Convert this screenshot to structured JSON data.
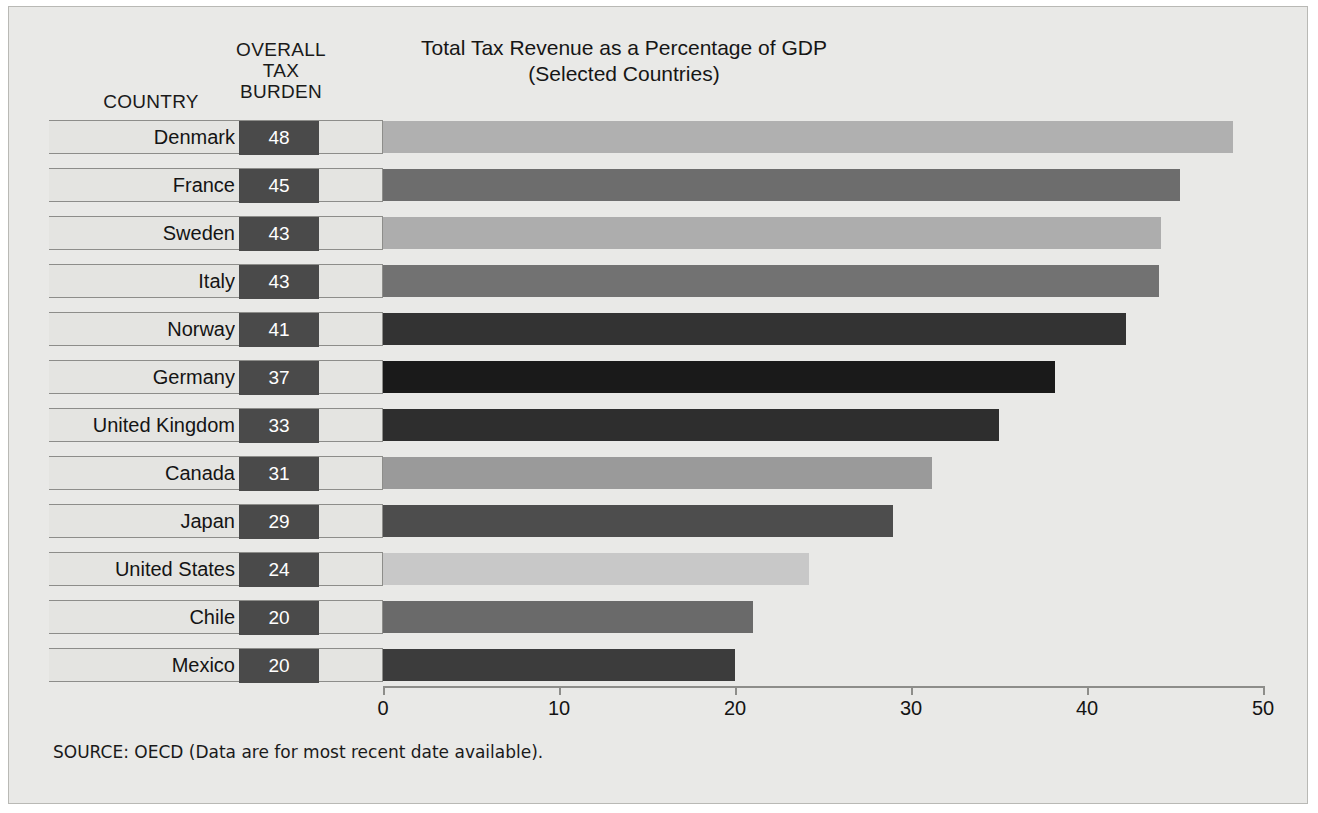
{
  "headers": {
    "country": "COUNTRY",
    "burden": "OVERALL\nTAX\nBURDEN"
  },
  "title": "Total Tax Revenue as a Percentage of GDP\n(Selected Countries)",
  "source": "SOURCE: OECD (Data are for most recent date available).",
  "chart_data": {
    "type": "bar",
    "orientation": "horizontal",
    "title": "Total Tax Revenue as a Percentage of GDP (Selected Countries)",
    "xlabel": "",
    "ylabel": "",
    "xlim": [
      0,
      50
    ],
    "ticks": [
      0,
      10,
      20,
      30,
      40,
      50
    ],
    "tick_labels": [
      "0",
      "10",
      "20",
      "30",
      "40",
      "50"
    ],
    "grid": false,
    "legend": "none",
    "categories": [
      "Denmark",
      "France",
      "Sweden",
      "Italy",
      "Norway",
      "Germany",
      "United Kingdom",
      "Canada",
      "Japan",
      "United States",
      "Chile",
      "Mexico"
    ],
    "values": [
      48,
      45,
      43,
      43,
      41,
      37,
      33,
      31,
      29,
      24,
      20,
      20
    ],
    "bar_lengths": [
      48.3,
      45.3,
      44.2,
      44.1,
      42.2,
      38.2,
      35.0,
      31.2,
      29.0,
      24.2,
      21.0,
      20.0
    ],
    "bar_colors": [
      "#b0b0b0",
      "#6d6d6d",
      "#adadad",
      "#727272",
      "#333333",
      "#1a1a1a",
      "#2e2e2e",
      "#9a9a9a",
      "#4d4d4d",
      "#c8c8c8",
      "#6a6a6a",
      "#3c3c3c"
    ],
    "rows": [
      {
        "country": "Denmark",
        "value": "48",
        "length": 48.3,
        "color": "#b0b0b0"
      },
      {
        "country": "France",
        "value": "45",
        "length": 45.3,
        "color": "#6d6d6d"
      },
      {
        "country": "Sweden",
        "value": "43",
        "length": 44.2,
        "color": "#adadad"
      },
      {
        "country": "Italy",
        "value": "43",
        "length": 44.1,
        "color": "#727272"
      },
      {
        "country": "Norway",
        "value": "41",
        "length": 42.2,
        "color": "#333333"
      },
      {
        "country": "Germany",
        "value": "37",
        "length": 38.2,
        "color": "#1a1a1a"
      },
      {
        "country": "United Kingdom",
        "value": "33",
        "length": 35.0,
        "color": "#2e2e2e"
      },
      {
        "country": "Canada",
        "value": "31",
        "length": 31.2,
        "color": "#9a9a9a"
      },
      {
        "country": "Japan",
        "value": "29",
        "length": 29.0,
        "color": "#4d4d4d"
      },
      {
        "country": "United States",
        "value": "24",
        "length": 24.2,
        "color": "#c8c8c8"
      },
      {
        "country": "Chile",
        "value": "20",
        "length": 21.0,
        "color": "#6a6a6a"
      },
      {
        "country": "Mexico",
        "value": "20",
        "length": 20.0,
        "color": "#3c3c3c"
      }
    ]
  },
  "geometry": {
    "x_zero_px": 374,
    "px_per_unit": 17.6,
    "first_row_top_px": 113,
    "row_pitch_px": 48
  }
}
